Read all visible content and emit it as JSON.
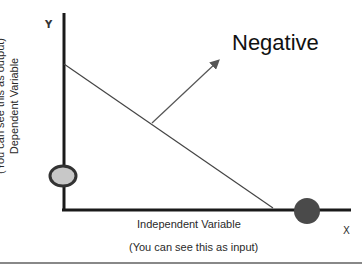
{
  "diagram": {
    "title": "Negative",
    "y_axis": {
      "letter": "Y",
      "label": "Dependent Variable",
      "note": "(You can see this as output)"
    },
    "x_axis": {
      "letter": "X",
      "label": "Independent Variable",
      "note": "(You can see this as input)"
    },
    "line": {
      "from": [
        64,
        64
      ],
      "to": [
        273,
        208
      ],
      "color": "#444444"
    },
    "arrow": {
      "from": [
        152,
        123
      ],
      "to": [
        219,
        60
      ],
      "color": "#555555"
    },
    "y_intercept_marker": {
      "cx": 63,
      "cy": 176,
      "rx": 14,
      "ry": 11,
      "fill": "#c8c8c8",
      "stroke": "#333333"
    },
    "x_intercept_marker": {
      "cx": 307,
      "cy": 211,
      "r": 14,
      "fill": "#4a4a4a"
    }
  }
}
